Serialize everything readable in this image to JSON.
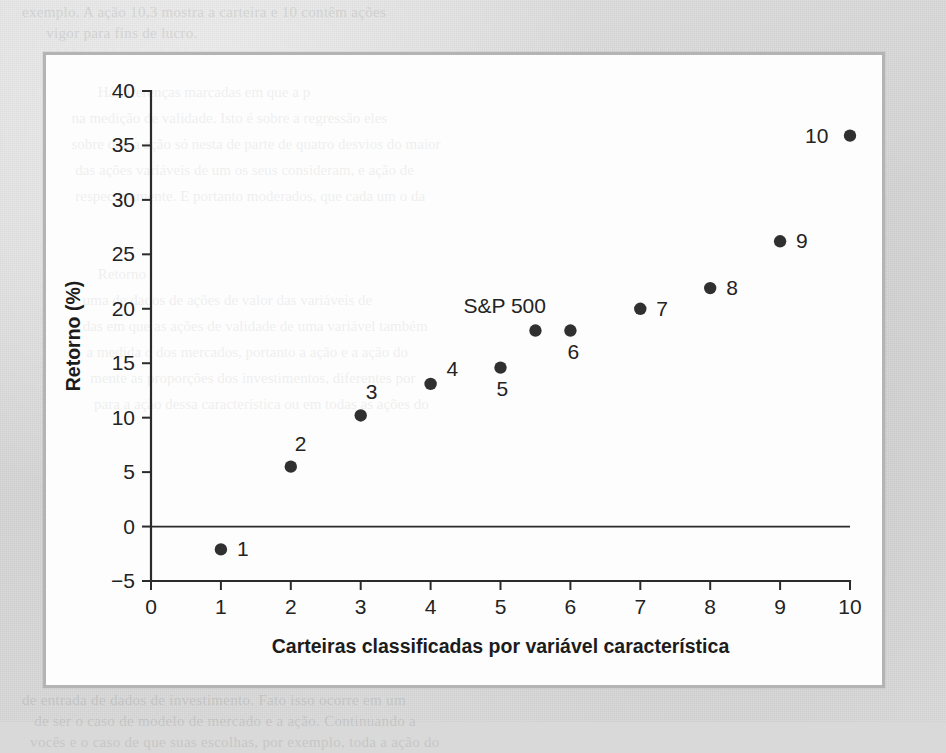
{
  "page": {
    "background_color": "#dcdcdc",
    "ghost_text_top": "exemplo. A ação 10,3 mostra a carteira e 10 contêm ações\n      vigor para fins de lucro.",
    "ghost_text_bottom": "de entrada de dados de investimento. Fato isso ocorre em um\n   de ser o caso de modelo de mercado e a ação. Continuando a\n  vocês e o caso de que suas escolhas, por exemplo, toda a ação do"
  },
  "figure": {
    "border_color": "#b4b4b4",
    "background_color": "#fdfdfd",
    "ghost_text": "         Há diferenças marcadas em que a p             \n  na medição de validade. Isto é sobre a regressão eles\n  sobre que a ação só nesta de parte de quatro desvios do maior\n   das ações variáveis de um os seus consideram, e ação de\n   respectivamente. E portanto moderados, que cada um o da\n\n\n         Retorno                                     \n     uma de dados de ações de valor das variáveis de\n     das em que as ações de validade de uma variável também\n      a medida o dos mercados, portanto a ação e a ação do\n       mente as proporções dos investimentos, diferentes por\n        para a ação dessa característica ou em todas as ações do"
  },
  "chart_data": {
    "type": "scatter",
    "title": "",
    "xlabel": "Carteiras classificadas por variável característica",
    "ylabel": "Retorno (%)",
    "xlim": [
      0,
      10
    ],
    "ylim": [
      -5,
      40
    ],
    "xticks": [
      "0",
      "1",
      "2",
      "3",
      "4",
      "5",
      "6",
      "7",
      "8",
      "9",
      "10"
    ],
    "yticks": [
      "40",
      "35",
      "30",
      "25",
      "20",
      "15",
      "10",
      "5",
      "0",
      "−5"
    ],
    "grid": false,
    "legend_position": "none",
    "zero_line": 0,
    "marker_color": "#303030",
    "series": [
      {
        "name": "Carteiras",
        "points": [
          {
            "label": "1",
            "x": 1,
            "y": -2.1,
            "label_dx": 16,
            "label_dy": 7
          },
          {
            "label": "2",
            "x": 2,
            "y": 5.5,
            "label_dx": 4,
            "label_dy": -16
          },
          {
            "label": "3",
            "x": 3,
            "y": 10.2,
            "label_dx": 5,
            "label_dy": -16
          },
          {
            "label": "4",
            "x": 4,
            "y": 13.1,
            "label_dx": 16,
            "label_dy": -8
          },
          {
            "label": "5",
            "x": 5,
            "y": 14.6,
            "label_dx": -4,
            "label_dy": 28
          },
          {
            "label": "6",
            "x": 6,
            "y": 18.0,
            "label_dx": -3,
            "label_dy": 28
          },
          {
            "label": "7",
            "x": 7,
            "y": 20.0,
            "label_dx": 16,
            "label_dy": 7
          },
          {
            "label": "8",
            "x": 8,
            "y": 21.9,
            "label_dx": 16,
            "label_dy": 7
          },
          {
            "label": "9",
            "x": 9,
            "y": 26.2,
            "label_dx": 16,
            "label_dy": 7
          },
          {
            "label": "10",
            "x": 10,
            "y": 35.9,
            "label_dx": -45,
            "label_dy": 7
          }
        ]
      },
      {
        "name": "S&P 500",
        "points": [
          {
            "label": "S&P 500",
            "x": 5.5,
            "y": 18.0,
            "label_dx": -72,
            "label_dy": -18
          }
        ]
      }
    ]
  }
}
